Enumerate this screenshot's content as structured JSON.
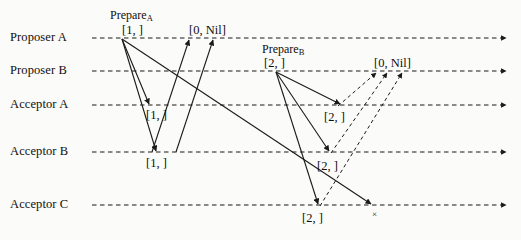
{
  "diagram": {
    "width": 521,
    "height": 240,
    "background_color": "#fbfbfa",
    "line_color": "#1a1a18",
    "lanes": [
      {
        "id": "proposer-a",
        "label": "Proposer A",
        "y": 38,
        "label_x": 10,
        "axis_start_x": 92,
        "axis_end_x": 506
      },
      {
        "id": "proposer-b",
        "label": "Proposer B",
        "y": 71,
        "label_x": 10,
        "axis_start_x": 92,
        "axis_end_x": 506
      },
      {
        "id": "acceptor-a",
        "label": "Acceptor A",
        "y": 105,
        "label_x": 10,
        "axis_start_x": 92,
        "axis_end_x": 506
      },
      {
        "id": "acceptor-b",
        "label": "Acceptor B",
        "y": 152,
        "label_x": 10,
        "axis_start_x": 92,
        "axis_end_x": 506
      },
      {
        "id": "acceptor-c",
        "label": "Acceptor C",
        "y": 205,
        "label_x": 10,
        "axis_start_x": 92,
        "axis_end_x": 506
      }
    ],
    "phase_labels": [
      {
        "id": "prepare-a",
        "text": "Prepare",
        "subscript": "A",
        "x": 110,
        "y": 8
      },
      {
        "id": "prepare-b",
        "text": "Prepare",
        "subscript": "B",
        "x": 262,
        "y": 42
      }
    ],
    "message_labels": [
      {
        "id": "prepare-a-value",
        "text": "[1, ]",
        "x": 122,
        "y": 23
      },
      {
        "id": "promise-a-value",
        "text": "[0, Nil]",
        "x": 189,
        "y": 23
      },
      {
        "id": "accept-a-acceptor-a",
        "text": "[1, ]",
        "x": 146,
        "y": 108
      },
      {
        "id": "accept-a-acceptor-b",
        "text": "[1, ]",
        "x": 146,
        "y": 156
      },
      {
        "id": "prepare-b-value",
        "text": "[2, ]",
        "x": 264,
        "y": 56
      },
      {
        "id": "promise-b-value",
        "text": "[0, Nil]",
        "x": 374,
        "y": 56
      },
      {
        "id": "accept-b-acceptor-a",
        "text": "[2, ]",
        "x": 324,
        "y": 110
      },
      {
        "id": "accept-b-acceptor-b",
        "text": "[2, ]",
        "x": 317,
        "y": 159
      },
      {
        "id": "accept-b-acceptor-c",
        "text": "[2, ]",
        "x": 302,
        "y": 211
      }
    ],
    "cross_marks": [
      {
        "id": "dropped-message-x",
        "text": "×",
        "x": 372,
        "y": 209
      }
    ],
    "solid_messages": [
      {
        "id": "prepare-a-to-acceptor-a",
        "x1": 122,
        "y1": 39,
        "x2": 149,
        "y2": 104
      },
      {
        "id": "prepare-a-to-acceptor-b",
        "x1": 122,
        "y1": 39,
        "x2": 156,
        "y2": 151
      },
      {
        "id": "prepare-a-to-acceptor-c",
        "x1": 122,
        "y1": 39,
        "x2": 371,
        "y2": 204
      },
      {
        "id": "promise-to-proposer-a-1",
        "x1": 152,
        "y1": 152,
        "x2": 189,
        "y2": 40
      },
      {
        "id": "promise-to-proposer-a-2",
        "x1": 176,
        "y1": 152,
        "x2": 213,
        "y2": 40
      },
      {
        "id": "prepare-b-to-acceptor-a",
        "x1": 276,
        "y1": 72,
        "x2": 340,
        "y2": 104
      },
      {
        "id": "prepare-b-to-acceptor-b",
        "x1": 276,
        "y1": 72,
        "x2": 329,
        "y2": 151
      },
      {
        "id": "prepare-b-to-acceptor-c",
        "x1": 276,
        "y1": 72,
        "x2": 318,
        "y2": 204
      }
    ],
    "dashed_messages": [
      {
        "id": "promise-b-from-acceptor-a",
        "x1": 338,
        "y1": 106,
        "x2": 376,
        "y2": 73
      },
      {
        "id": "promise-b-from-acceptor-b",
        "x1": 331,
        "y1": 153,
        "x2": 387,
        "y2": 73
      },
      {
        "id": "promise-b-from-acceptor-c",
        "x1": 320,
        "y1": 206,
        "x2": 402,
        "y2": 73
      }
    ]
  }
}
